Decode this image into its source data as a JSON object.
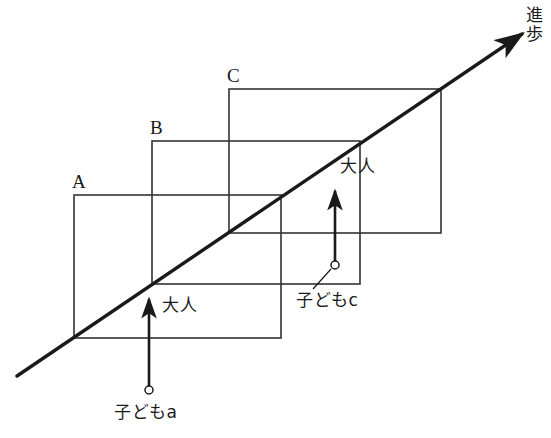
{
  "diagram": {
    "title_axis_label": "進歩",
    "stages": [
      {
        "id": "A",
        "label": "A",
        "x": 74,
        "y": 195,
        "w": 207,
        "h": 143,
        "label_x": 72,
        "label_y": 172
      },
      {
        "id": "B",
        "label": "B",
        "x": 152,
        "y": 141,
        "w": 208,
        "h": 143,
        "label_x": 150,
        "label_y": 118
      },
      {
        "id": "C",
        "label": "C",
        "x": 229,
        "y": 89,
        "w": 212,
        "h": 144,
        "label_x": 227,
        "label_y": 66
      }
    ],
    "axis": {
      "name": "progress-axis",
      "label": "進歩",
      "label_x": 524,
      "label_y": 6,
      "x1": 17,
      "y1": 376,
      "x2": 522,
      "y2": 34
    },
    "vectors": [
      {
        "id": "a",
        "child_label": "子どもa",
        "adult_label": "大人",
        "circle_x": 149,
        "circle_y": 390,
        "tip_x": 149,
        "tip_y": 299,
        "child_label_x": 114,
        "child_label_y": 404,
        "adult_label_x": 162,
        "adult_label_y": 297,
        "has_leader": false
      },
      {
        "id": "c",
        "child_label": "子どもc",
        "adult_label": "大人",
        "circle_x": 335,
        "circle_y": 265,
        "tip_x": 335,
        "tip_y": 191,
        "child_label_x": 296,
        "child_label_y": 292,
        "adult_label_x": 340,
        "adult_label_y": 158,
        "has_leader": true,
        "leader_x1": 331,
        "leader_y1": 269,
        "leader_x2": 313,
        "leader_y2": 289
      }
    ],
    "colors": {
      "ink": "#1a1a1a",
      "rect_stroke": "#333333",
      "background": "#ffffff"
    }
  }
}
